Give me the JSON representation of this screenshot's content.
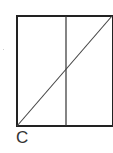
{
  "figure": {
    "label": "C",
    "stroke_color": "#222222",
    "shapes": {
      "rectangle": {
        "x1": 17,
        "y1": 16,
        "x2": 112,
        "y2": 126
      },
      "vertical_line": {
        "x": 66,
        "y1": 16,
        "y2": 126
      },
      "diagonal_line": {
        "x1": 17,
        "y1": 126,
        "x2": 112,
        "y2": 16
      }
    }
  }
}
